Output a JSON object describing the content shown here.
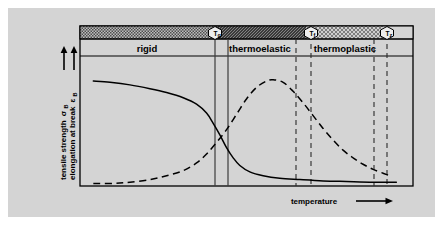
{
  "figure": {
    "background_color": "#d4d4d4",
    "frame_color": "#000000",
    "page_color": "#ffffff"
  },
  "axes": {
    "y_label_line1": "tensile strength",
    "y_label_line1_sym": "σ",
    "y_label_line1_sub": "B",
    "y_label_line2": "elongation at break",
    "y_label_line2_sym": "ε",
    "y_label_line2_sub": "B",
    "x_label": "temperature",
    "x_arrow": "→",
    "y_arrow_count": 2
  },
  "regions": [
    {
      "name": "rigid",
      "label": "rigid",
      "pattern": "medium-dither",
      "fill": "#8f8f8f"
    },
    {
      "name": "thermoelastic",
      "label": "thermoelastic",
      "pattern": "dense-hatch",
      "fill": "#4a4a4a"
    },
    {
      "name": "thermoplastic",
      "label": "thermoplastic",
      "pattern": "light-dots",
      "fill": "#b8b8b8"
    }
  ],
  "markers": [
    {
      "name": "glass-transition",
      "symbol": "T",
      "subscript": "g",
      "x_pct": 40.5
    },
    {
      "name": "flow-temperature",
      "symbol": "T",
      "subscript": "f",
      "x_pct": 68.0
    },
    {
      "name": "decomposition",
      "symbol": "T",
      "subscript": "z",
      "x_pct": 90.5
    }
  ],
  "boundary_lines": [
    {
      "name": "tg-left",
      "x_pct": 40.5,
      "style": "solid"
    },
    {
      "name": "tg-right",
      "x_pct": 44.5,
      "style": "solid"
    },
    {
      "name": "tf-left",
      "x_pct": 65.0,
      "style": "dashed"
    },
    {
      "name": "tf-right",
      "x_pct": 69.5,
      "style": "dashed"
    },
    {
      "name": "tz-left",
      "x_pct": 88.5,
      "style": "dashed"
    },
    {
      "name": "tz-right",
      "x_pct": 92.5,
      "style": "dashed"
    }
  ],
  "chart_data": {
    "type": "line",
    "title": "",
    "xlabel": "temperature",
    "ylabel": "tensile strength σB / elongation at break εB",
    "xlim": [
      0,
      100
    ],
    "ylim": [
      0,
      100
    ],
    "grid": false,
    "legend": "none",
    "series": [
      {
        "name": "tensile strength",
        "symbol": "σB",
        "style": "solid",
        "color": "#000000",
        "points": [
          [
            4,
            82
          ],
          [
            9,
            81
          ],
          [
            15,
            79
          ],
          [
            21,
            76
          ],
          [
            26,
            73
          ],
          [
            31,
            69
          ],
          [
            35,
            64
          ],
          [
            38,
            57
          ],
          [
            40,
            49
          ],
          [
            42,
            40
          ],
          [
            44,
            30
          ],
          [
            46,
            22
          ],
          [
            48,
            16
          ],
          [
            51,
            11
          ],
          [
            55,
            8
          ],
          [
            60,
            6
          ],
          [
            66,
            5
          ],
          [
            73,
            4
          ],
          [
            80,
            3.5
          ],
          [
            88,
            3
          ],
          [
            95,
            3
          ]
        ]
      },
      {
        "name": "elongation at break",
        "symbol": "εB",
        "style": "dashed",
        "color": "#000000",
        "points": [
          [
            4,
            2
          ],
          [
            10,
            2
          ],
          [
            15,
            3
          ],
          [
            21,
            5
          ],
          [
            26,
            8
          ],
          [
            31,
            12
          ],
          [
            35,
            18
          ],
          [
            38,
            25
          ],
          [
            41,
            34
          ],
          [
            44,
            44
          ],
          [
            47,
            56
          ],
          [
            50,
            68
          ],
          [
            53,
            77
          ],
          [
            56,
            82
          ],
          [
            58,
            83
          ],
          [
            61,
            81
          ],
          [
            64,
            74
          ],
          [
            67,
            65
          ],
          [
            70,
            55
          ],
          [
            73,
            45
          ],
          [
            76,
            36
          ],
          [
            79,
            28
          ],
          [
            82,
            22
          ],
          [
            85,
            17
          ],
          [
            88,
            13
          ],
          [
            91,
            10
          ],
          [
            93,
            8
          ]
        ]
      }
    ]
  }
}
